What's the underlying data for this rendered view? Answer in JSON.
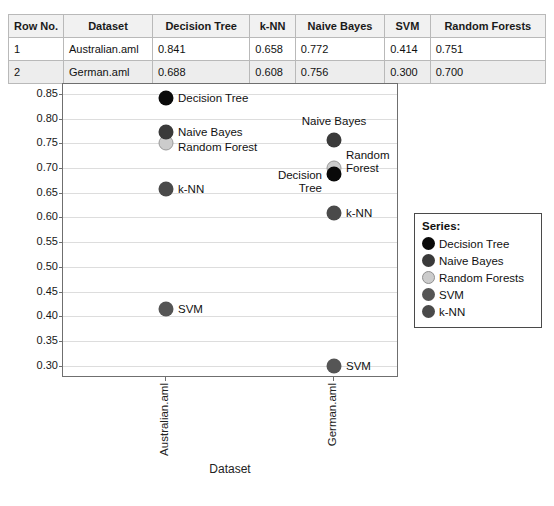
{
  "table": {
    "headers": [
      "Row No.",
      "Dataset",
      "Decision Tree",
      "k-NN",
      "Naive Bayes",
      "SVM",
      "Random Forests"
    ],
    "rows": [
      {
        "row_no": "1",
        "dataset": "Australian.aml",
        "decision_tree": "0.841",
        "knn": "0.658",
        "naive_bayes": "0.772",
        "svm": "0.414",
        "random_forests": "0.751"
      },
      {
        "row_no": "2",
        "dataset": "German.aml",
        "decision_tree": "0.688",
        "knn": "0.608",
        "naive_bayes": "0.756",
        "svm": "0.300",
        "random_forests": "0.700"
      }
    ]
  },
  "legend": {
    "title": "Series:",
    "items": [
      {
        "label": "Decision Tree",
        "color": "#0a0a0a"
      },
      {
        "label": "Naive Bayes",
        "color": "#3a3a3a"
      },
      {
        "label": "Random Forests",
        "color": "#cccccc"
      },
      {
        "label": "SVM",
        "color": "#555555"
      },
      {
        "label": "k-NN",
        "color": "#4a4a4a"
      }
    ]
  },
  "chart_data": {
    "type": "scatter",
    "title": "",
    "xlabel": "Dataset",
    "ylabel": "",
    "categories": [
      "Australian.aml",
      "German.aml"
    ],
    "ylim": [
      0.3,
      0.85
    ],
    "ytick_labels": [
      "0.85",
      "0.80",
      "0.75",
      "0.70",
      "0.65",
      "0.60",
      "0.55",
      "0.50",
      "0.45",
      "0.40",
      "0.35",
      "0.30"
    ],
    "grid": true,
    "legend_position": "right",
    "series": [
      {
        "name": "Decision Tree",
        "color": "#0a0a0a",
        "values": [
          0.841,
          0.688
        ]
      },
      {
        "name": "Naive Bayes",
        "color": "#3a3a3a",
        "values": [
          0.772,
          0.756
        ]
      },
      {
        "name": "Random Forests",
        "color": "#cccccc",
        "values": [
          0.751,
          0.7
        ]
      },
      {
        "name": "SVM",
        "color": "#555555",
        "values": [
          0.414,
          0.3
        ]
      },
      {
        "name": "k-NN",
        "color": "#4a4a4a",
        "values": [
          0.658,
          0.608
        ]
      }
    ],
    "point_annotations": [
      {
        "text": "Decision Tree",
        "series": "Decision Tree",
        "category": "Australian.aml"
      },
      {
        "text": "Naive Bayes",
        "series": "Naive Bayes",
        "category": "Australian.aml"
      },
      {
        "text": "Random Forest",
        "series": "Random Forests",
        "category": "Australian.aml"
      },
      {
        "text": "k-NN",
        "series": "k-NN",
        "category": "Australian.aml"
      },
      {
        "text": "SVM",
        "series": "SVM",
        "category": "Australian.aml"
      },
      {
        "text": "Naive Bayes",
        "series": "Naive Bayes",
        "category": "German.aml"
      },
      {
        "text": "Random\nForest",
        "series": "Random Forests",
        "category": "German.aml"
      },
      {
        "text": "Decision\nTree",
        "series": "Decision Tree",
        "category": "German.aml"
      },
      {
        "text": "k-NN",
        "series": "k-NN",
        "category": "German.aml"
      },
      {
        "text": "SVM",
        "series": "SVM",
        "category": "German.aml"
      }
    ]
  }
}
